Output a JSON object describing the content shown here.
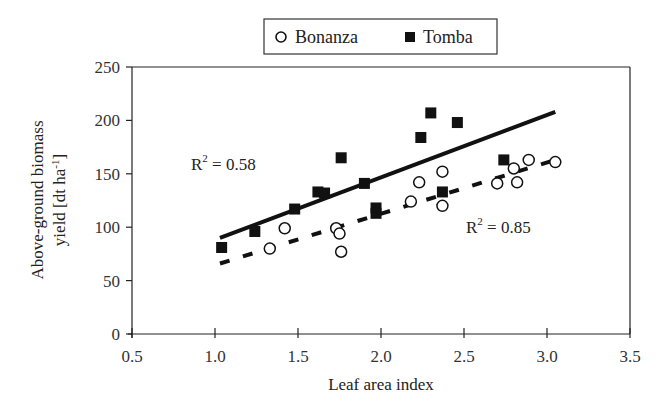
{
  "legend": {
    "items": [
      {
        "label": "Bonanza",
        "marker": "open-circle"
      },
      {
        "label": "Tomba",
        "marker": "filled-square"
      }
    ]
  },
  "annotations": {
    "tomba_r2": "R² = 0.58",
    "tomba_r2_base": "R",
    "tomba_r2_exp": "2",
    "tomba_r2_val": " = 0.58",
    "bonanza_r2_base": "R",
    "bonanza_r2_exp": "2",
    "bonanza_r2_val": " = 0.85"
  },
  "colors": {
    "ink": "#111111",
    "background": "#ffffff"
  },
  "chart_data": {
    "type": "scatter",
    "title": "",
    "xlabel": "Leaf area index",
    "ylabel": "Above-ground biomass yield [dt ha-1]",
    "ylabel_line1": "Above-ground biomass",
    "ylabel_line2": "yield [dt ha",
    "ylabel_sup": "-1",
    "ylabel_end": "]",
    "xlim": [
      0.5,
      3.5
    ],
    "ylim": [
      0,
      250
    ],
    "xticks": [
      "0.5",
      "1.0",
      "1.5",
      "2.0",
      "2.5",
      "3.0",
      "3.5"
    ],
    "yticks": [
      "0",
      "50",
      "100",
      "150",
      "200",
      "250"
    ],
    "grid": false,
    "legend_position": "top-center",
    "series": [
      {
        "name": "Bonanza",
        "marker": "open-circle",
        "x": [
          1.33,
          1.42,
          1.73,
          1.75,
          1.76,
          2.18,
          2.23,
          2.37,
          2.37,
          2.7,
          2.8,
          2.82,
          2.89,
          3.05
        ],
        "y": [
          80,
          99,
          99,
          94,
          77,
          124,
          142,
          120,
          152,
          141,
          155,
          142,
          163,
          161
        ],
        "trendline": {
          "style": "dashed",
          "x": [
            1.03,
            3.05
          ],
          "y": [
            66,
            163
          ],
          "r2": 0.85
        }
      },
      {
        "name": "Tomba",
        "marker": "filled-square",
        "x": [
          1.04,
          1.24,
          1.48,
          1.62,
          1.66,
          1.76,
          1.9,
          1.97,
          1.97,
          2.24,
          2.3,
          2.37,
          2.46,
          2.74
        ],
        "y": [
          81,
          96,
          117,
          133,
          132,
          165,
          141,
          118,
          113,
          184,
          207,
          133,
          198,
          163
        ],
        "trendline": {
          "style": "solid",
          "x": [
            1.03,
            3.05
          ],
          "y": [
            90,
            208
          ],
          "r2": 0.58
        }
      }
    ]
  }
}
